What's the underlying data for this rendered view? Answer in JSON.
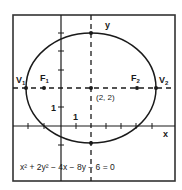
{
  "diagram": {
    "equation": "x² + 2y² − 4x − 8y − 6 = 0",
    "axes": {
      "x_label": "x",
      "y_label": "y",
      "tick_label_x": "1",
      "tick_label_y": "1"
    },
    "center_label": "(2, 2)",
    "points": [
      {
        "name": "V",
        "sub": "1"
      },
      {
        "name": "F",
        "sub": "1"
      },
      {
        "name": "F",
        "sub": "2"
      },
      {
        "name": "V",
        "sub": "2"
      }
    ],
    "colors": {
      "stroke": "#1a1a1a",
      "background": "#ffffff"
    }
  }
}
